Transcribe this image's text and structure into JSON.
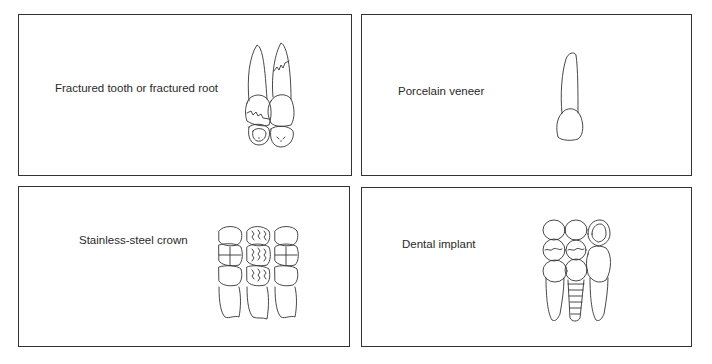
{
  "panels": [
    {
      "label": "Fractured tooth or fractured root",
      "figure": "fractured-teeth-illustration"
    },
    {
      "label": "Porcelain veneer",
      "figure": "veneer-tooth-illustration"
    },
    {
      "label": "Stainless-steel crown",
      "figure": "stainless-steel-crown-illustration"
    },
    {
      "label": "Dental implant",
      "figure": "dental-implant-illustration"
    }
  ],
  "colors": {
    "border": "#333333",
    "background": "#ffffff",
    "text": "#2a2a2a"
  }
}
